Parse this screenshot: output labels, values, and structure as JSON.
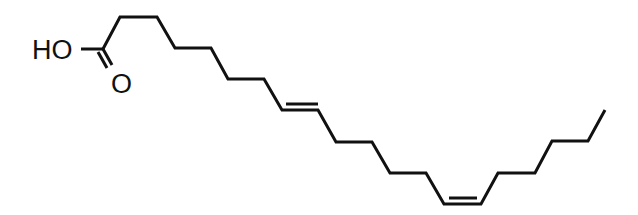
{
  "diagram": {
    "type": "skeletal-formula",
    "atom_labels": {
      "hydroxyl": "HO",
      "carbonyl_oxygen": "O"
    },
    "double_bonds": [
      {
        "position": "first",
        "geometry": "trans (E)"
      },
      {
        "position": "second",
        "geometry": "cis (Z)"
      }
    ],
    "colors": {
      "bond": "#111111",
      "background": "#ffffff"
    }
  }
}
